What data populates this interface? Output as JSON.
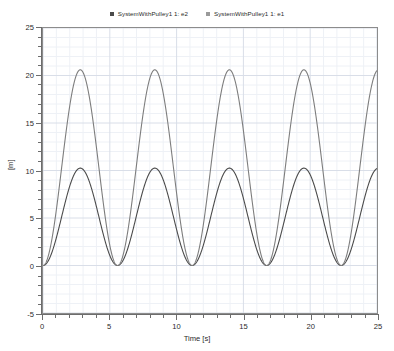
{
  "chart_data": {
    "type": "line",
    "title": "",
    "xlabel": "Time [s]",
    "ylabel": "[m]",
    "xlim": [
      0,
      25
    ],
    "ylim": [
      -5,
      25
    ],
    "xticks": [
      0,
      5,
      10,
      15,
      20,
      25
    ],
    "yticks": [
      -5,
      0,
      5,
      10,
      15,
      20,
      25
    ],
    "xtick_labels": [
      "0",
      "5",
      "10",
      "15",
      "20",
      "25"
    ],
    "ytick_labels": [
      "-5",
      "0",
      "5",
      "10",
      "15",
      "20",
      "25"
    ],
    "grid": true,
    "minor_grid": true,
    "legend_position": "top-center",
    "series": [
      {
        "name": "SystemWithPulley1 1: e2",
        "color": "#4a4a4a",
        "amplitude": 10.25,
        "offset": 5.125,
        "period": 5.58,
        "phase_shift": 0.0,
        "peak_value": 10.25,
        "trough_value": 0.0,
        "peaks_x": [
          2.82,
          8.4,
          13.98,
          19.56
        ],
        "troughs_x": [
          0.0,
          5.6,
          11.18,
          16.76,
          22.34
        ],
        "end_value": 10.1
      },
      {
        "name": "SystemWithPulley1 1: e1",
        "color": "#7d7d7d",
        "amplitude": 20.6,
        "offset": 10.3,
        "period": 5.58,
        "phase_shift": 0.0,
        "peak_value": 20.6,
        "trough_value": 0.0,
        "peaks_x": [
          2.86,
          8.44,
          14.02,
          19.6
        ],
        "troughs_x": [
          0.0,
          5.62,
          11.2,
          16.78,
          22.36
        ],
        "end_value": 20.6
      }
    ]
  },
  "legend": {
    "entries": [
      {
        "label": "SystemWithPulley1 1: e2",
        "marker": "square-marker-icon",
        "color": "#4a4a4a"
      },
      {
        "label": "SystemWithPulley1 1: e1",
        "marker": "square-marker-icon",
        "color": "#9a9a9a"
      }
    ]
  },
  "axis_titles": {
    "x": "Time [s]",
    "y": "[m]"
  },
  "colors": {
    "plot_background": "#ffffff",
    "frame": "#8c8c8c",
    "major_grid": "#d9dee8",
    "minor_grid": "#eef1f6",
    "axis": "#6d6d6d",
    "text": "#2a2a2a"
  }
}
